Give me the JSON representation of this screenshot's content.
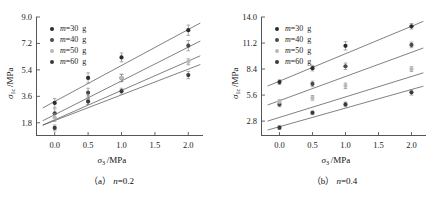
{
  "figure": {
    "panels": [
      {
        "id": "a",
        "caption": "(a)  n=0.2",
        "caption_symbol": "n",
        "caption_value": "=0.2"
      },
      {
        "id": "b",
        "caption": "(b)  n=0.4",
        "caption_symbol": "n",
        "caption_value": "=0.4"
      }
    ]
  },
  "axis_text": {
    "xlabel_symbol": "σ",
    "xlabel_sub": "3",
    "xlabel_unit": "/MPa",
    "ylabel_symbol": "σ",
    "ylabel_sub": "1c",
    "ylabel_unit": "/MPa"
  },
  "legend": {
    "items": [
      {
        "label_symbol": "m",
        "label_value": "=30",
        "label_unit": "g",
        "color": "#2b2b2b"
      },
      {
        "label_symbol": "m",
        "label_value": "=40",
        "label_unit": "g",
        "color": "#4a4a4a"
      },
      {
        "label_symbol": "m",
        "label_value": "=50",
        "label_unit": "g",
        "color": "#b9b9b9"
      },
      {
        "label_symbol": "m",
        "label_value": "=60",
        "label_unit": "g",
        "color": "#3a3a3a"
      }
    ]
  },
  "chart_data": [
    {
      "type": "scatter",
      "panel": "a",
      "title": "(a) n=0.2",
      "xlabel": "σ3/MPa",
      "ylabel": "σ1c/MPa",
      "xticks": [
        0.0,
        0.5,
        1.0,
        1.5,
        2.0
      ],
      "xtick_labels": [
        "0.0",
        "0.5",
        "1.0",
        "1.5",
        "2.0"
      ],
      "yticks": [
        1.8,
        3.6,
        5.4,
        7.2,
        9.0
      ],
      "ytick_labels": [
        "1.8",
        "3.6",
        "5.4",
        "7.2",
        "9.0"
      ],
      "xlim": [
        -0.28,
        2.22
      ],
      "ylim": [
        0.9,
        9.0
      ],
      "grid": false,
      "legend_position": "upper-left",
      "series": [
        {
          "name": "m=30 g",
          "color": "#2b2b2b",
          "x": [
            0.0,
            0.5,
            1.0,
            2.0
          ],
          "values": [
            3.15,
            4.85,
            6.25,
            8.1
          ],
          "yerr": [
            0.3,
            0.35,
            0.3,
            0.35
          ],
          "fit": {
            "intercept": 3.25,
            "slope": 2.45
          }
        },
        {
          "name": "m=40 g",
          "color": "#4a4a4a",
          "x": [
            0.0,
            0.5,
            1.0,
            2.0
          ],
          "values": [
            2.45,
            3.85,
            4.85,
            7.05
          ],
          "yerr": [
            0.3,
            0.3,
            0.25,
            0.35
          ],
          "fit": {
            "intercept": 2.35,
            "slope": 2.3
          }
        },
        {
          "name": "m=50 g",
          "color": "#b9b9b9",
          "x": [
            0.0,
            0.5,
            1.0,
            2.0
          ],
          "values": [
            2.15,
            3.35,
            4.85,
            5.95
          ],
          "yerr": [
            0.25,
            0.3,
            0.25,
            0.2
          ],
          "fit": {
            "intercept": 2.0,
            "slope": 2.0
          }
        },
        {
          "name": "m=60 g",
          "color": "#3a3a3a",
          "x": [
            0.0,
            0.5,
            1.0,
            2.0
          ],
          "values": [
            1.45,
            3.25,
            3.95,
            5.05
          ],
          "yerr": [
            0.2,
            0.2,
            0.2,
            0.25
          ],
          "fit": {
            "intercept": 1.95,
            "slope": 1.75
          }
        }
      ]
    },
    {
      "type": "scatter",
      "panel": "b",
      "title": "(b) n=0.4",
      "xlabel": "σ3/MPa",
      "ylabel": "σ1c/MPa",
      "xticks": [
        0.0,
        0.5,
        1.0,
        1.5,
        2.0
      ],
      "xtick_labels": [
        "0.0",
        "0.5",
        "1.0",
        "1.5",
        "2.0"
      ],
      "yticks": [
        2.8,
        5.6,
        8.4,
        11.2,
        14.0
      ],
      "ytick_labels": [
        "2.8",
        "5.6",
        "8.4",
        "11.2",
        "14.0"
      ],
      "xlim": [
        -0.28,
        2.22
      ],
      "ylim": [
        1.2,
        14.0
      ],
      "grid": false,
      "legend_position": "upper-left",
      "series": [
        {
          "name": "m=30 g",
          "color": "#2b2b2b",
          "x": [
            0.0,
            0.5,
            1.0,
            2.0
          ],
          "values": [
            7.0,
            8.5,
            10.9,
            13.0
          ],
          "yerr": [
            0.25,
            0.3,
            0.45,
            0.3
          ],
          "fit": {
            "intercept": 7.1,
            "slope": 2.95
          }
        },
        {
          "name": "m=40 g",
          "color": "#4a4a4a",
          "x": [
            0.0,
            0.5,
            1.0,
            2.0
          ],
          "values": [
            4.6,
            6.8,
            8.7,
            11.0
          ],
          "yerr": [
            0.25,
            0.3,
            0.35,
            0.3
          ],
          "fit": {
            "intercept": 5.0,
            "slope": 2.6
          }
        },
        {
          "name": "m=50 g",
          "color": "#b9b9b9",
          "x": [
            0.0,
            0.5,
            1.0,
            2.0
          ],
          "values": [
            4.9,
            5.3,
            6.6,
            8.4
          ],
          "yerr": [
            0.2,
            0.25,
            0.3,
            0.25
          ],
          "fit": {
            "intercept": 3.2,
            "slope": 2.2
          }
        },
        {
          "name": "m=60 g",
          "color": "#3a3a3a",
          "x": [
            0.0,
            0.5,
            1.0,
            2.0
          ],
          "values": [
            2.1,
            3.7,
            4.6,
            5.9
          ],
          "yerr": [
            0.2,
            0.2,
            0.25,
            0.3
          ],
          "fit": {
            "intercept": 2.2,
            "slope": 2.0
          }
        }
      ]
    }
  ]
}
